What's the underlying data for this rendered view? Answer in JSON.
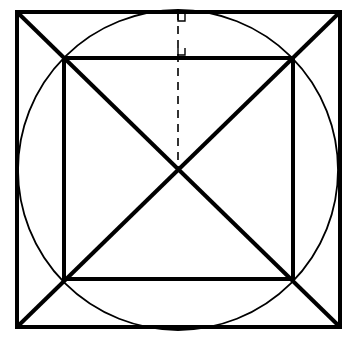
{
  "diagram": {
    "title": "",
    "colors": {
      "stroke": "#000000",
      "background": "#ffffff"
    },
    "outer_square": {
      "x1": 17,
      "y1": 12,
      "x2": 340,
      "y2": 327,
      "stroke_width": 4
    },
    "circle": {
      "cx": 178,
      "cy": 170,
      "r": 160,
      "stroke_width": 1.8
    },
    "inner_square": {
      "x1": 64,
      "y1": 58,
      "x2": 293,
      "y2": 279,
      "stroke_width": 4
    },
    "diagonals": [
      {
        "x1": 17,
        "y1": 12,
        "x2": 340,
        "y2": 327
      },
      {
        "x1": 340,
        "y1": 12,
        "x2": 17,
        "y2": 327
      }
    ],
    "dashed_segment": {
      "x1": 178,
      "y1": 12,
      "x2": 178,
      "y2": 170,
      "dash": "8,6"
    },
    "right_angle_markers": [
      {
        "x": 178,
        "y": 14,
        "size": 7
      },
      {
        "x": 178,
        "y": 48,
        "size": 7
      }
    ]
  }
}
